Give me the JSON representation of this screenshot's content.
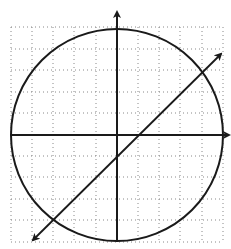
{
  "diagram": {
    "grid": {
      "x_min": -5,
      "x_max": 5,
      "y_min": -5,
      "y_max": 5,
      "step": 1,
      "style": "dotted"
    },
    "axes": {
      "x_axis_arrow": "right",
      "y_axis_arrow": "up",
      "labels_shown": false
    },
    "circle": {
      "center": [
        0,
        0
      ],
      "radius": 5
    },
    "line": {
      "equation": "y = x - 1",
      "slope": 1,
      "y_intercept": -1,
      "x_intercept": 1,
      "arrows": "both"
    },
    "intersections": [
      [
        4,
        3
      ],
      [
        -3,
        -4
      ]
    ],
    "colors": {
      "stroke": "#1a1a1a",
      "grid": "#888888",
      "background": "#ffffff"
    }
  }
}
